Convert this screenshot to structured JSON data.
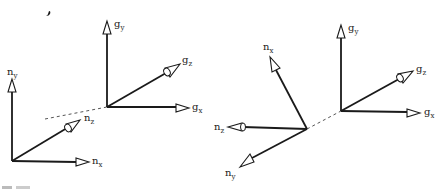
{
  "figure": {
    "panels": [
      {
        "id": "left",
        "frames": [
          {
            "name": "n",
            "origin": "lower-left",
            "axes": [
              {
                "label": "n",
                "subscript": "y",
                "direction": "up",
                "kind": "in-plane"
              },
              {
                "label": "n",
                "subscript": "x",
                "direction": "right",
                "kind": "in-plane"
              },
              {
                "label": "n",
                "subscript": "z",
                "direction": "up-right (out of plane)",
                "kind": "out-of-plane"
              }
            ]
          },
          {
            "name": "g",
            "origin": "center",
            "axes": [
              {
                "label": "g",
                "subscript": "y",
                "direction": "up",
                "kind": "in-plane"
              },
              {
                "label": "g",
                "subscript": "x",
                "direction": "right",
                "kind": "in-plane"
              },
              {
                "label": "g",
                "subscript": "z",
                "direction": "up-right (out of plane)",
                "kind": "out-of-plane"
              }
            ]
          }
        ],
        "connector": "dashed line between frame origins"
      },
      {
        "id": "right",
        "frames": [
          {
            "name": "n",
            "origin": "center-left",
            "axes": [
              {
                "label": "n",
                "subscript": "x",
                "direction": "up-left",
                "kind": "in-plane"
              },
              {
                "label": "n",
                "subscript": "z",
                "direction": "left (out of plane)",
                "kind": "out-of-plane"
              },
              {
                "label": "n",
                "subscript": "y",
                "direction": "down-left",
                "kind": "in-plane"
              }
            ]
          },
          {
            "name": "g",
            "origin": "center-right",
            "axes": [
              {
                "label": "g",
                "subscript": "y",
                "direction": "up",
                "kind": "in-plane"
              },
              {
                "label": "g",
                "subscript": "x",
                "direction": "right",
                "kind": "in-plane"
              },
              {
                "label": "g",
                "subscript": "z",
                "direction": "up-right (out of plane)",
                "kind": "out-of-plane"
              }
            ]
          }
        ],
        "connector": "dashed line between frame origins"
      }
    ]
  },
  "labels": {
    "l_ny": {
      "base": "n",
      "sub": "y"
    },
    "l_nx": {
      "base": "n",
      "sub": "x"
    },
    "l_nz": {
      "base": "n",
      "sub": "z"
    },
    "l_gy": {
      "base": "g",
      "sub": "y"
    },
    "l_gz": {
      "base": "g",
      "sub": "z"
    },
    "l_gx": {
      "base": "g",
      "sub": "x"
    },
    "r_nx": {
      "base": "n",
      "sub": "x"
    },
    "r_nz": {
      "base": "n",
      "sub": "z"
    },
    "r_ny": {
      "base": "n",
      "sub": "y"
    },
    "r_gy": {
      "base": "g",
      "sub": "y"
    },
    "r_gz": {
      "base": "g",
      "sub": "z"
    },
    "r_gx": {
      "base": "g",
      "sub": "x"
    }
  }
}
